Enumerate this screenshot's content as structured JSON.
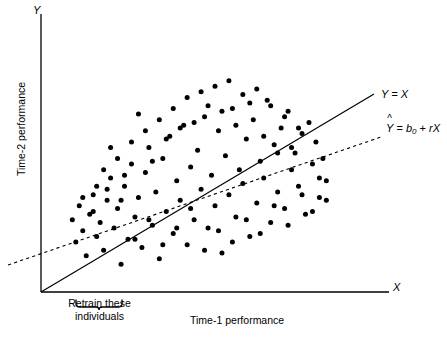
{
  "chart_data": {
    "type": "scatter",
    "title": "",
    "xlabel": "Time-1 performance",
    "ylabel": "Time-2 performance",
    "x_axis_tip_label": "X",
    "y_axis_tip_label": "Y",
    "grid": false,
    "xlim": [
      0,
      100
    ],
    "ylim": [
      0,
      100
    ],
    "axis_ticks": false,
    "legend_position": "inline-right",
    "annotations": [
      {
        "name": "retrain-brace",
        "text_line_1": "Retrain these",
        "text_line_2": "individuals",
        "x_range": [
          9,
          23
        ]
      }
    ],
    "series": [
      {
        "name": "identity-line",
        "type": "line",
        "label": "Y = X",
        "style": "solid",
        "color": "#000000",
        "slope": 1.0,
        "intercept": 0.0,
        "x_range": [
          0,
          83
        ]
      },
      {
        "name": "regression-line",
        "type": "line",
        "label": "Ŷ = b₀ + rX",
        "style": "dashed",
        "color": "#000000",
        "slope": 0.5,
        "intercept": 12,
        "x_range": [
          -9,
          85
        ]
      },
      {
        "name": "observations",
        "type": "scatter",
        "marker": "filled-circle",
        "color": "#000000",
        "marker_size_px": 5,
        "count": 120,
        "points": [
          [
            9,
            26
          ],
          [
            10,
            18
          ],
          [
            11,
            31
          ],
          [
            12,
            22
          ],
          [
            13,
            13
          ],
          [
            14,
            28
          ],
          [
            15,
            35
          ],
          [
            16,
            20
          ],
          [
            17,
            25
          ],
          [
            18,
            15
          ],
          [
            19,
            33
          ],
          [
            20,
            41
          ],
          [
            21,
            23
          ],
          [
            22,
            30
          ],
          [
            23,
            10
          ],
          [
            24,
            38
          ],
          [
            25,
            19
          ],
          [
            26,
            46
          ],
          [
            27,
            27
          ],
          [
            28,
            34
          ],
          [
            29,
            16
          ],
          [
            30,
            43
          ],
          [
            31,
            52
          ],
          [
            32,
            24
          ],
          [
            33,
            36
          ],
          [
            34,
            12
          ],
          [
            35,
            48
          ],
          [
            36,
            29
          ],
          [
            37,
            56
          ],
          [
            38,
            21
          ],
          [
            39,
            40
          ],
          [
            40,
            33
          ],
          [
            41,
            60
          ],
          [
            42,
            17
          ],
          [
            43,
            45
          ],
          [
            44,
            26
          ],
          [
            45,
            51
          ],
          [
            46,
            37
          ],
          [
            47,
            63
          ],
          [
            48,
            23
          ],
          [
            49,
            42
          ],
          [
            50,
            31
          ],
          [
            51,
            58
          ],
          [
            52,
            14
          ],
          [
            53,
            49
          ],
          [
            54,
            35
          ],
          [
            55,
            66
          ],
          [
            56,
            27
          ],
          [
            57,
            44
          ],
          [
            58,
            39
          ],
          [
            59,
            55
          ],
          [
            60,
            20
          ],
          [
            61,
            62
          ],
          [
            62,
            32
          ],
          [
            63,
            47
          ],
          [
            64,
            41
          ],
          [
            65,
            69
          ],
          [
            66,
            25
          ],
          [
            67,
            53
          ],
          [
            68,
            36
          ],
          [
            69,
            59
          ],
          [
            70,
            30
          ],
          [
            71,
            65
          ],
          [
            72,
            44
          ],
          [
            73,
            50
          ],
          [
            74,
            38
          ],
          [
            75,
            57
          ],
          [
            76,
            28
          ],
          [
            77,
            61
          ],
          [
            78,
            46
          ],
          [
            79,
            54
          ],
          [
            80,
            34
          ],
          [
            81,
            48
          ],
          [
            82,
            40
          ],
          [
            18,
            44
          ],
          [
            22,
            48
          ],
          [
            26,
            54
          ],
          [
            30,
            58
          ],
          [
            34,
            62
          ],
          [
            38,
            66
          ],
          [
            42,
            70
          ],
          [
            46,
            72
          ],
          [
            50,
            74
          ],
          [
            54,
            76
          ],
          [
            58,
            71
          ],
          [
            62,
            73
          ],
          [
            66,
            67
          ],
          [
            70,
            63
          ],
          [
            74,
            59
          ],
          [
            16,
            38
          ],
          [
            20,
            52
          ],
          [
            24,
            42
          ],
          [
            28,
            64
          ],
          [
            32,
            47
          ],
          [
            36,
            55
          ],
          [
            40,
            59
          ],
          [
            44,
            61
          ],
          [
            48,
            67
          ],
          [
            52,
            65
          ],
          [
            56,
            60
          ],
          [
            60,
            68
          ],
          [
            64,
            56
          ],
          [
            68,
            50
          ],
          [
            72,
            52
          ],
          [
            12,
            34
          ],
          [
            15,
            29
          ],
          [
            19,
            37
          ],
          [
            23,
            33
          ],
          [
            27,
            19
          ],
          [
            31,
            26
          ],
          [
            35,
            17
          ],
          [
            39,
            23
          ],
          [
            43,
            30
          ],
          [
            47,
            15
          ],
          [
            51,
            22
          ],
          [
            55,
            18
          ],
          [
            59,
            26
          ],
          [
            63,
            21
          ],
          [
            67,
            31
          ],
          [
            71,
            24
          ],
          [
            75,
            35
          ],
          [
            78,
            29
          ],
          [
            80,
            41
          ],
          [
            82,
            33
          ]
        ]
      }
    ]
  }
}
